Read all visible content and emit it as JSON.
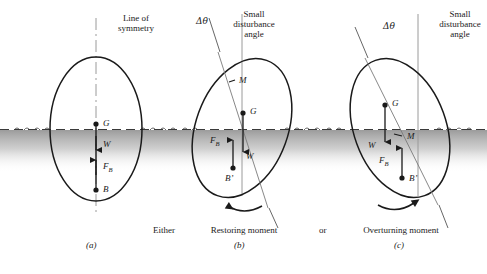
{
  "figure": {
    "title_alt": "Stability of a floating body: metacenter and restoring/overturning moments",
    "colors": {
      "outline": "#1a1a1a",
      "water_line": "#444444",
      "water_fill": "#8f8f8f",
      "axis_line": "#8a8a8a",
      "tilt_line": "#6e6e6e",
      "text": "#1a1a1a"
    }
  },
  "panels": [
    {
      "id": "a",
      "caption": "(a)",
      "top_label_line1": "Line of",
      "top_label_line2": "symmetry",
      "points": [
        {
          "name": "G",
          "label": "G"
        },
        {
          "name": "B",
          "label": "B"
        }
      ],
      "forces": [
        {
          "name": "W",
          "label": "W",
          "direction": "down"
        },
        {
          "name": "FB",
          "label": "F",
          "sub": "B",
          "direction": "up"
        }
      ]
    },
    {
      "id": "b",
      "caption": "(b)",
      "angle_label": "Δθ",
      "top_label_line1": "Small",
      "top_label_line2": "disturbance",
      "top_label_line3": "angle",
      "moment_prefix": "Either",
      "moment_label": "Restoring moment",
      "moment_suffix": "or",
      "points": [
        {
          "name": "M",
          "label": "M"
        },
        {
          "name": "G",
          "label": "G"
        },
        {
          "name": "Bprime",
          "label": "B’"
        }
      ],
      "forces": [
        {
          "name": "W",
          "label": "W",
          "direction": "down"
        },
        {
          "name": "FB",
          "label": "F",
          "sub": "B",
          "direction": "up"
        }
      ],
      "rotation_sense": "counterclockwise"
    },
    {
      "id": "c",
      "caption": "(c)",
      "angle_label": "Δθ",
      "top_label_line1": "Small",
      "top_label_line2": "disturbance",
      "top_label_line3": "angle",
      "moment_label": "Overturning moment",
      "points": [
        {
          "name": "G",
          "label": "G"
        },
        {
          "name": "M",
          "label": "M"
        },
        {
          "name": "Bprime",
          "label": "B’"
        }
      ],
      "forces": [
        {
          "name": "W",
          "label": "W",
          "direction": "down"
        },
        {
          "name": "FB",
          "label": "F",
          "sub": "B",
          "direction": "up"
        }
      ],
      "rotation_sense": "clockwise"
    }
  ]
}
